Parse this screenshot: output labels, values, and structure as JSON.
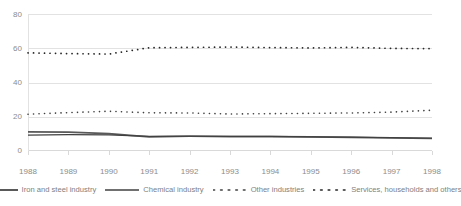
{
  "chart_data": {
    "type": "line",
    "title": "",
    "xlabel": "",
    "ylabel": "",
    "x": [
      1988,
      1989,
      1990,
      1991,
      1992,
      1993,
      1994,
      1995,
      1996,
      1997,
      1998
    ],
    "xtick_labels": [
      "1988",
      "1989",
      "1990",
      "1991",
      "1992",
      "1993",
      "1994",
      "1995",
      "1996",
      "1997",
      "1998"
    ],
    "ytick_labels": [
      "0",
      "20",
      "40",
      "60",
      "80"
    ],
    "yticks": [
      0,
      20,
      40,
      60,
      80
    ],
    "ylim": [
      0,
      80
    ],
    "grid": "horizontal",
    "legend_position": "bottom",
    "series": [
      {
        "name": "Iron and steel industry",
        "style": "solid",
        "color": "#595959",
        "values": [
          11.2,
          11.0,
          10.2,
          8.3,
          8.6,
          8.4,
          8.4,
          8.2,
          8.0,
          7.6,
          7.3
        ]
      },
      {
        "name": "Chemical industry",
        "style": "solid",
        "color": "#404040",
        "values": [
          9.3,
          9.6,
          9.4,
          8.5,
          8.7,
          8.5,
          8.5,
          8.3,
          8.1,
          7.8,
          7.5
        ]
      },
      {
        "name": "Other industries",
        "style": "dotted",
        "color": "#404040",
        "values": [
          21.5,
          22.4,
          23.2,
          22.3,
          22.2,
          21.6,
          21.8,
          22.0,
          22.2,
          22.7,
          23.8
        ]
      },
      {
        "name": "Services, households and others",
        "style": "dotted",
        "color": "#262626",
        "values": [
          57.3,
          56.9,
          56.6,
          60.3,
          60.5,
          60.7,
          60.4,
          60.2,
          60.5,
          59.9,
          59.8
        ]
      }
    ]
  },
  "legend": {
    "items": [
      {
        "label": "Iron and steel industry",
        "marker": "solid-line-swatch"
      },
      {
        "label": "Chemical industry",
        "marker": "solid-line-swatch"
      },
      {
        "label": "Other industries",
        "marker": "dotted-line-swatch"
      },
      {
        "label": "Services, households and others",
        "marker": "dotted-line-swatch"
      }
    ]
  }
}
